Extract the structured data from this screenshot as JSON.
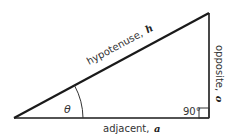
{
  "diagram": {
    "type": "right-triangle",
    "labels": {
      "hypotenuse": "hypotenuse,",
      "hypotenuse_var": "h",
      "opposite": "opposite,",
      "opposite_var": "o",
      "adjacent": "adjacent,",
      "adjacent_var": "a",
      "angle": "θ",
      "right_angle": "90°"
    },
    "colors": {
      "stroke": "#1a1a1a",
      "text": "#333333",
      "background": "#ffffff"
    }
  }
}
